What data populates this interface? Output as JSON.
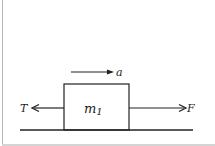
{
  "diagram": {
    "type": "free-body diagram",
    "block": {
      "label": "m",
      "subscript": "1"
    },
    "acceleration": {
      "label": "a",
      "direction": "right"
    },
    "forces": [
      {
        "label": "T",
        "direction": "left"
      },
      {
        "label": "F",
        "direction": "right"
      }
    ],
    "surface": "horizontal ground line",
    "colors": {
      "stroke": "#222222",
      "background": "#ffffff",
      "frame": "#b8b8b8"
    }
  }
}
